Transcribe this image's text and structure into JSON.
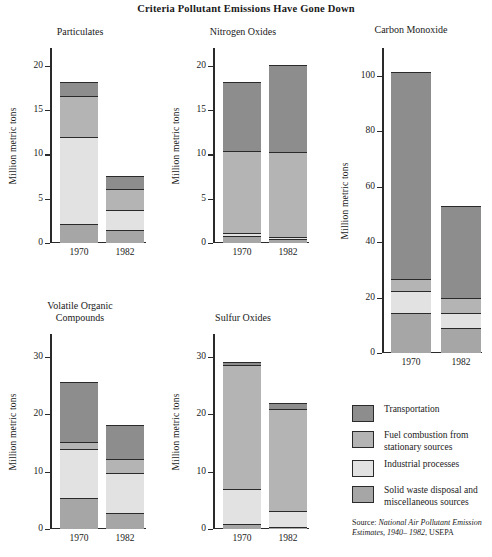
{
  "figure": {
    "title": "Criteria Pollutant Emissions Have Gone Down",
    "ylabel": "Million metric tons",
    "source_prefix": "Source: ",
    "source_italic": "National Air Pollutant Emission Estimates, 1940– 1982",
    "source_suffix": ", USEPA"
  },
  "legend": {
    "items": [
      {
        "label": "Transportation",
        "color": "#8d8d8d"
      },
      {
        "label": "Fuel combustion from\nstationary sources",
        "color": "#b4b4b4"
      },
      {
        "label": "Industrial processes",
        "color": "#e2e2e2"
      },
      {
        "label": "Solid waste disposal and\nmiscellaneous sources",
        "color": "#a6a6a6"
      }
    ]
  },
  "chart_data": [
    {
      "type": "bar",
      "subtype": "stacked",
      "title": "Particulates",
      "xlabel": "",
      "ylabel": "Million metric tons",
      "categories": [
        "1970",
        "1982"
      ],
      "yticks": [
        0,
        5,
        10,
        15,
        20
      ],
      "ylim": [
        0,
        22
      ],
      "grid": false,
      "legend_position": "external-bottom-right",
      "series": [
        {
          "name": "Solid waste disposal and miscellaneous sources",
          "color": "#a6a6a6",
          "values": [
            2.0,
            1.3
          ]
        },
        {
          "name": "Industrial processes",
          "color": "#e2e2e2",
          "values": [
            9.9,
            2.3
          ]
        },
        {
          "name": "Fuel combustion from stationary sources",
          "color": "#b4b4b4",
          "values": [
            4.6,
            2.4
          ]
        },
        {
          "name": "Transportation",
          "color": "#8d8d8d",
          "values": [
            1.5,
            1.4
          ]
        }
      ],
      "totals": [
        18.0,
        7.4
      ]
    },
    {
      "type": "bar",
      "subtype": "stacked",
      "title": "Nitrogen Oxides",
      "xlabel": "",
      "ylabel": "Million metric tons",
      "categories": [
        "1970",
        "1982"
      ],
      "yticks": [
        0,
        5,
        10,
        15,
        20
      ],
      "ylim": [
        0,
        22
      ],
      "grid": false,
      "series": [
        {
          "name": "Solid waste disposal and miscellaneous sources",
          "color": "#a6a6a6",
          "values": [
            0.7,
            0.3
          ]
        },
        {
          "name": "Industrial processes",
          "color": "#e2e2e2",
          "values": [
            0.3,
            0.3
          ]
        },
        {
          "name": "Fuel combustion from stationary sources",
          "color": "#b4b4b4",
          "values": [
            9.3,
            9.6
          ]
        },
        {
          "name": "Transportation",
          "color": "#8d8d8d",
          "values": [
            7.7,
            9.8
          ]
        }
      ],
      "totals": [
        18.0,
        20.0
      ]
    },
    {
      "type": "bar",
      "subtype": "stacked",
      "title": "Carbon Monoxide",
      "xlabel": "",
      "ylabel": "Million metric tons",
      "categories": [
        "1970",
        "1982"
      ],
      "yticks": [
        0,
        20,
        40,
        60,
        80,
        100
      ],
      "ylim": [
        0,
        110
      ],
      "grid": false,
      "series": [
        {
          "name": "Solid waste disposal and miscellaneous sources",
          "color": "#a6a6a6",
          "values": [
            14.0,
            8.5
          ]
        },
        {
          "name": "Industrial processes",
          "color": "#e2e2e2",
          "values": [
            8.0,
            5.5
          ]
        },
        {
          "name": "Fuel combustion from stationary sources",
          "color": "#b4b4b4",
          "values": [
            4.5,
            5.5
          ]
        },
        {
          "name": "Transportation",
          "color": "#8d8d8d",
          "values": [
            74.5,
            33.0
          ]
        }
      ],
      "totals": [
        101.0,
        52.5
      ]
    },
    {
      "type": "bar",
      "subtype": "stacked",
      "title": "Volatile Organic\nCompounds",
      "xlabel": "",
      "ylabel": "Million metric tons",
      "categories": [
        "1970",
        "1982"
      ],
      "yticks": [
        0,
        10,
        20,
        30
      ],
      "ylim": [
        0,
        34
      ],
      "grid": false,
      "series": [
        {
          "name": "Solid waste disposal and miscellaneous sources",
          "color": "#a6a6a6",
          "values": [
            5.2,
            2.7
          ]
        },
        {
          "name": "Industrial processes",
          "color": "#e2e2e2",
          "values": [
            8.5,
            6.9
          ]
        },
        {
          "name": "Fuel combustion from stationary sources",
          "color": "#b4b4b4",
          "values": [
            1.3,
            2.4
          ]
        },
        {
          "name": "Transportation",
          "color": "#8d8d8d",
          "values": [
            10.4,
            5.9
          ]
        }
      ],
      "totals": [
        25.4,
        17.9
      ]
    },
    {
      "type": "bar",
      "subtype": "stacked",
      "title": "Sulfur Oxides",
      "xlabel": "",
      "ylabel": "Million metric tons",
      "categories": [
        "1970",
        "1982"
      ],
      "yticks": [
        0,
        10,
        20,
        30
      ],
      "ylim": [
        0,
        34
      ],
      "grid": false,
      "series": [
        {
          "name": "Solid waste disposal and miscellaneous sources",
          "color": "#a6a6a6",
          "values": [
            0.7,
            0.2
          ]
        },
        {
          "name": "Industrial processes",
          "color": "#e2e2e2",
          "values": [
            6.1,
            2.8
          ]
        },
        {
          "name": "Fuel combustion from stationary sources",
          "color": "#b4b4b4",
          "values": [
            21.6,
            17.8
          ]
        },
        {
          "name": "Transportation",
          "color": "#8d8d8d",
          "values": [
            0.5,
            1.0
          ]
        }
      ],
      "totals": [
        28.9,
        21.8
      ]
    }
  ]
}
